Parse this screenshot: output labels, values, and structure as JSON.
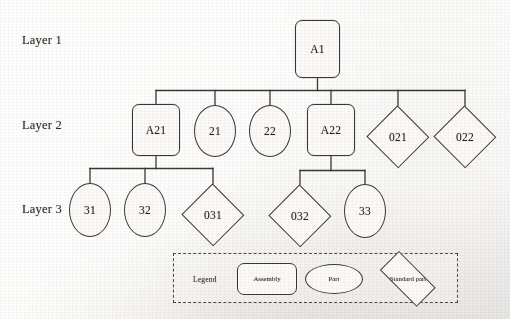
{
  "diagram": {
    "stroke_color": "#3a3836",
    "text_color": "#24221f",
    "background_color": "#f3f2f0"
  },
  "layers": [
    {
      "label": "Layer 1"
    },
    {
      "label": "Layer 2"
    },
    {
      "label": "Layer 3"
    }
  ],
  "nodes": {
    "a1": {
      "label": "A1",
      "type": "assembly"
    },
    "a21": {
      "label": "A21",
      "type": "assembly"
    },
    "p21": {
      "label": "21",
      "type": "part"
    },
    "p22": {
      "label": "22",
      "type": "part"
    },
    "a22": {
      "label": "A22",
      "type": "assembly"
    },
    "s021": {
      "label": "021",
      "type": "standard"
    },
    "s022": {
      "label": "022",
      "type": "standard"
    },
    "p31": {
      "label": "31",
      "type": "part"
    },
    "p32": {
      "label": "32",
      "type": "part"
    },
    "s031": {
      "label": "031",
      "type": "standard"
    },
    "s032": {
      "label": "032",
      "type": "standard"
    },
    "p33": {
      "label": "33",
      "type": "part"
    }
  },
  "legend": {
    "title": "Legend",
    "items": [
      {
        "label": "Assembly",
        "type": "assembly"
      },
      {
        "label": "Part",
        "type": "part"
      },
      {
        "label": "Standard part",
        "type": "standard"
      }
    ]
  }
}
